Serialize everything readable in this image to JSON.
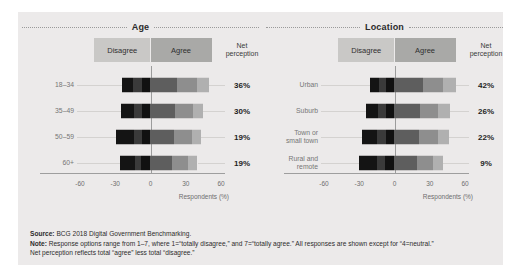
{
  "legend": {
    "disagree": "Disagree",
    "agree": "Agree",
    "net_line1": "Net",
    "net_line2": "perception"
  },
  "axis": {
    "ticks": [
      "-60",
      "-30",
      "0",
      "30",
      "60"
    ],
    "tick_values": [
      -60,
      -30,
      0,
      30,
      60
    ],
    "title": "Respondents (%)"
  },
  "footnotes": {
    "source_label": "Source:",
    "source_text": " BCG 2018 Digital Government Benchmarking.",
    "note_label": "Note:",
    "note_text": " Response options range from 1–7, where 1=“totally disagree,” and 7=“totally agree.” All responses are shown except for “4=neutral.”",
    "note_line2": "Net perception reflects total “agree” less total “disagree.”"
  },
  "colors": {
    "panel_bg": "#eceaea",
    "disagree_header": "#c9c8c6",
    "agree_header": "#a9a9a7",
    "zero_line": "#9c9c9c",
    "disagree_shades": [
      "#141414",
      "#3a3a3a",
      "#111111"
    ],
    "agree_shades": [
      "#5e5e5e",
      "#8e8e8e",
      "#b0b0b0"
    ]
  },
  "chart_data": [
    {
      "type": "bar",
      "title": "Age",
      "xlabel": "Respondents (%)",
      "ylabel": "",
      "xlim": [
        -60,
        60
      ],
      "grid": false,
      "legend": "top",
      "orientation": "horizontal-diverging-stacked",
      "categories": [
        "18–34",
        "35–49",
        "50–59",
        "60+"
      ],
      "series": [
        {
          "name": "1=totally disagree",
          "side": "disagree",
          "values": [
            -9,
            -11,
            -15,
            -13
          ]
        },
        {
          "name": "2",
          "side": "disagree",
          "values": [
            -8,
            -7,
            -7,
            -5
          ]
        },
        {
          "name": "3",
          "side": "disagree",
          "values": [
            -7,
            -7,
            -7,
            -8
          ]
        },
        {
          "name": "5",
          "side": "agree",
          "values": [
            23,
            21,
            20,
            18
          ]
        },
        {
          "name": "6",
          "side": "agree",
          "values": [
            17,
            15,
            15,
            14
          ]
        },
        {
          "name": "7=totally agree",
          "side": "agree",
          "values": [
            10,
            9,
            8,
            8
          ]
        }
      ],
      "net_perception": [
        "36%",
        "30%",
        "19%",
        "19%"
      ],
      "net_perception_values": [
        36,
        30,
        19,
        19
      ]
    },
    {
      "type": "bar",
      "title": "Location",
      "xlabel": "Respondents (%)",
      "ylabel": "",
      "xlim": [
        -60,
        60
      ],
      "grid": false,
      "legend": "top",
      "orientation": "horizontal-diverging-stacked",
      "categories": [
        "Urban",
        "Suburb",
        "Town or small town",
        "Rural and remote"
      ],
      "categories_wrapped": [
        [
          "Urban"
        ],
        [
          "Suburb"
        ],
        [
          "Town or",
          "small town"
        ],
        [
          "Rural and",
          "remote"
        ]
      ],
      "series": [
        {
          "name": "1=totally disagree",
          "side": "disagree",
          "values": [
            -8,
            -10,
            -13,
            -15
          ]
        },
        {
          "name": "2",
          "side": "disagree",
          "values": [
            -6,
            -7,
            -8,
            -7
          ]
        },
        {
          "name": "3",
          "side": "disagree",
          "values": [
            -7,
            -7,
            -7,
            -8
          ]
        },
        {
          "name": "5",
          "side": "agree",
          "values": [
            24,
            22,
            21,
            19
          ]
        },
        {
          "name": "6",
          "side": "agree",
          "values": [
            17,
            15,
            16,
            14
          ]
        },
        {
          "name": "7=totally agree",
          "side": "agree",
          "values": [
            11,
            10,
            9,
            8
          ]
        }
      ],
      "net_perception": [
        "42%",
        "26%",
        "22%",
        "9%"
      ],
      "net_perception_values": [
        42,
        26,
        22,
        9
      ]
    }
  ]
}
